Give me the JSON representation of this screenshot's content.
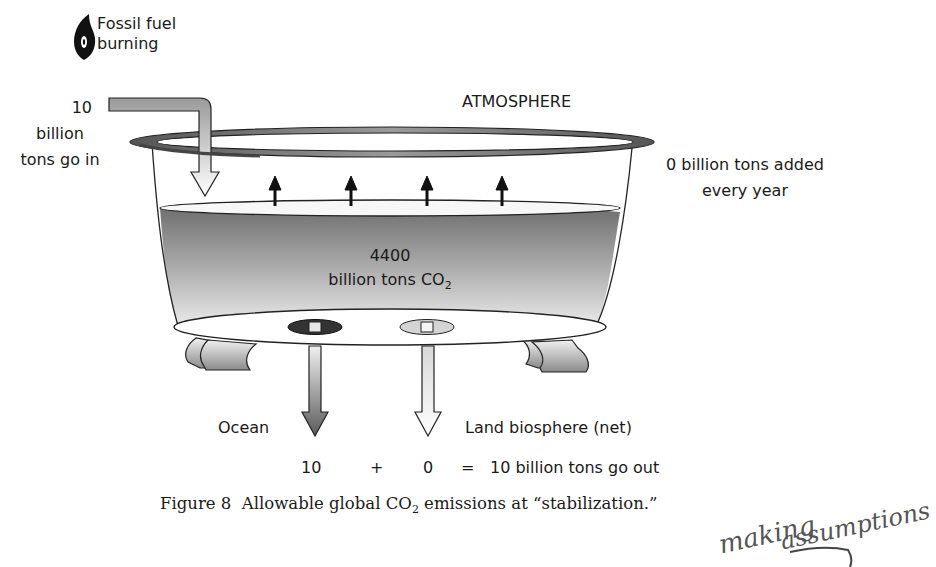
{
  "figure": {
    "number": "Figure 8",
    "caption_prefix": "Allowable global CO",
    "caption_sub": "2",
    "caption_suffix": " emissions at “stabilization.”"
  },
  "legend": {
    "source_icon": "flame-icon",
    "source_line1": "Fossil fuel",
    "source_line2": "burning"
  },
  "inflow": {
    "amount": "10",
    "line2": "billion",
    "line3": "tons go in"
  },
  "atmosphere": {
    "title": "ATMOSPHERE",
    "added_line1": "0  billion tons added",
    "added_line2": "every year"
  },
  "reservoir": {
    "amount": "4400",
    "unit_prefix": "billion tons CO",
    "unit_sub": "2"
  },
  "outflows": {
    "ocean_label": "Ocean",
    "land_label": "Land biosphere (net)"
  },
  "equation": {
    "ocean_value": "10",
    "plus": "+",
    "land_value": "0",
    "equals": "=",
    "total": "10 billion tons go out"
  },
  "annotation": {
    "handwritten_line1": "making",
    "handwritten_line2": "assumptions"
  },
  "colors": {
    "ink": "#1a1a1a",
    "water_dark": "#6e6e6e",
    "water_light": "#f2f2f2",
    "rim": "#7a7a7a",
    "ocean_drain": "#3a3a3a",
    "land_drain": "#cfcfcf"
  }
}
